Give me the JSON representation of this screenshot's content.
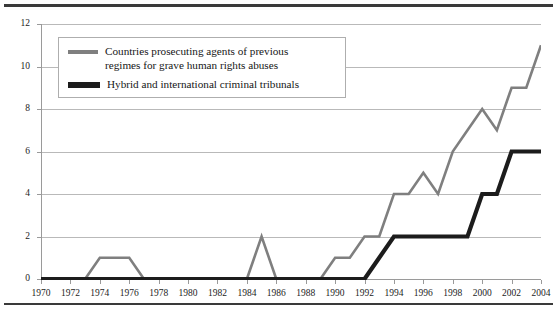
{
  "chart_data": {
    "type": "line",
    "title": "",
    "subtitle": "",
    "xlabel": "",
    "ylabel": "",
    "xlim": [
      1970,
      2004
    ],
    "ylim": [
      0,
      12
    ],
    "y_ticks": [
      0,
      2,
      4,
      6,
      8,
      10,
      12
    ],
    "x_ticks": [
      1970,
      1972,
      1974,
      1976,
      1978,
      1980,
      1982,
      1984,
      1986,
      1988,
      1990,
      1992,
      1994,
      1996,
      1998,
      2000,
      2002,
      2004
    ],
    "grid": "horizontal",
    "legend_position": "upper-left-inside",
    "x": [
      1970,
      1971,
      1972,
      1973,
      1974,
      1975,
      1976,
      1977,
      1978,
      1979,
      1980,
      1981,
      1982,
      1983,
      1984,
      1985,
      1986,
      1987,
      1988,
      1989,
      1990,
      1991,
      1992,
      1993,
      1994,
      1995,
      1996,
      1997,
      1998,
      1999,
      2000,
      2001,
      2002,
      2003,
      2004
    ],
    "series": [
      {
        "name": "Countries prosecuting agents of previous regimes for grave human rights abuses",
        "color": "#7f7f7f",
        "values": [
          0,
          0,
          0,
          0,
          1,
          1,
          1,
          0,
          0,
          0,
          0,
          0,
          0,
          0,
          0,
          2,
          0,
          0,
          0,
          0,
          1,
          1,
          2,
          2,
          4,
          4,
          5,
          4,
          6,
          7,
          8,
          7,
          9,
          9,
          11
        ]
      },
      {
        "name": "Hybrid and international criminal tribunals",
        "color": "#1c1c1c",
        "values": [
          0,
          0,
          0,
          0,
          0,
          0,
          0,
          0,
          0,
          0,
          0,
          0,
          0,
          0,
          0,
          0,
          0,
          0,
          0,
          0,
          0,
          0,
          0,
          1,
          2,
          2,
          2,
          2,
          2,
          2,
          4,
          4,
          6,
          6,
          6
        ]
      }
    ]
  },
  "legend": {
    "items": [
      {
        "label": "Countries prosecuting agents of previous\nregimes for grave human rights abuses",
        "swatch": "gray-line-swatch"
      },
      {
        "label": "Hybrid and international criminal tribunals",
        "swatch": "black-line-swatch"
      }
    ]
  }
}
